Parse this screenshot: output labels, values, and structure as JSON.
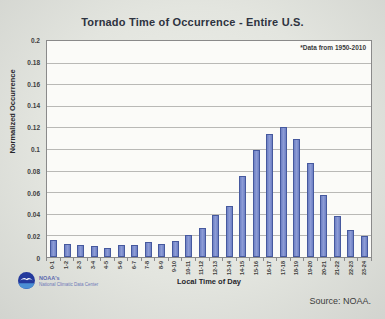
{
  "chart_data": {
    "type": "bar",
    "title": "Tornado Time of Occurrence - Entire U.S.",
    "annotation": "*Data from 1950-2010",
    "xlabel": "Local Time of Day",
    "ylabel": "Normalized Occurrence",
    "ylim": [
      0,
      0.2
    ],
    "ytick_step": 0.02,
    "yticks": [
      "0.2",
      "0.18",
      "0.16",
      "0.14",
      "0.12",
      "0.1",
      "0.08",
      "0.06",
      "0.04",
      "0.02",
      "0"
    ],
    "grid": true,
    "legend": "none",
    "bar_color": "#7486c7",
    "bar_border_color": "#46599e",
    "categories": [
      "0-1",
      "1-2",
      "2-3",
      "3-4",
      "4-5",
      "5-6",
      "6-7",
      "7-8",
      "8-9",
      "9-10",
      "10-11",
      "11-12",
      "12-13",
      "13-14",
      "14-15",
      "15-16",
      "16-17",
      "17-18",
      "18-19",
      "19-20",
      "20-21",
      "21-22",
      "22-23",
      "23-24"
    ],
    "values": [
      0.016,
      0.012,
      0.011,
      0.01,
      0.008,
      0.011,
      0.011,
      0.014,
      0.012,
      0.015,
      0.02,
      0.027,
      0.039,
      0.047,
      0.075,
      0.099,
      0.114,
      0.12,
      0.109,
      0.087,
      0.057,
      0.038,
      0.025,
      0.019
    ]
  },
  "footer": {
    "logo_line1": "NOAA's",
    "logo_line2": "National Climatic Data Center",
    "source": "Source: NOAA."
  }
}
